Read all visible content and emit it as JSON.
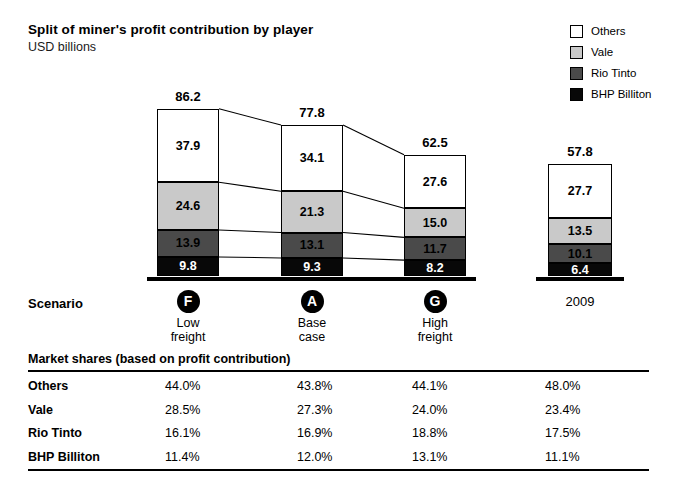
{
  "header": {
    "title": "Split of miner's profit contribution by player",
    "subtitle": "USD billions"
  },
  "legend": {
    "items": [
      {
        "label": "Others",
        "color": "#ffffff",
        "swatch": "others-swatch"
      },
      {
        "label": "Vale",
        "color": "#c9c9c9",
        "swatch": "vale-swatch"
      },
      {
        "label": "Rio Tinto",
        "color": "#4a4a4a",
        "swatch": "rio-tinto-swatch"
      },
      {
        "label": "BHP Billiton",
        "color": "#080808",
        "swatch": "bhp-billiton-swatch"
      }
    ]
  },
  "axis": {
    "scenario_label": "Scenario",
    "columns": [
      {
        "badge": "F",
        "line1": "Low",
        "line2": "freight",
        "is_year": false
      },
      {
        "badge": "A",
        "line1": "Base",
        "line2": "case",
        "is_year": false
      },
      {
        "badge": "G",
        "line1": "High",
        "line2": "freight",
        "is_year": false
      },
      {
        "badge": "",
        "line1": "2009",
        "line2": "",
        "is_year": true
      }
    ]
  },
  "table": {
    "title": "Market shares (based on profit contribution)",
    "rows": [
      {
        "name": "Others",
        "values": [
          "44.0%",
          "43.8%",
          "44.1%",
          "48.0%"
        ]
      },
      {
        "name": "Vale",
        "values": [
          "28.5%",
          "27.3%",
          "24.0%",
          "23.4%"
        ]
      },
      {
        "name": "Rio Tinto",
        "values": [
          "16.1%",
          "16.9%",
          "18.8%",
          "17.5%"
        ]
      },
      {
        "name": "BHP Billiton",
        "values": [
          "11.4%",
          "12.0%",
          "13.1%",
          "11.1%"
        ]
      }
    ]
  },
  "chart_data": {
    "type": "bar",
    "stacked": true,
    "title": "Split of miner's profit contribution by player",
    "subtitle": "USD billions",
    "xlabel": "Scenario",
    "ylabel": "USD billions",
    "categories": [
      "Low freight",
      "Base case",
      "High freight",
      "2009"
    ],
    "category_badges": [
      "F",
      "A",
      "G",
      ""
    ],
    "series": [
      {
        "name": "Others",
        "color": "#ffffff",
        "values": [
          37.9,
          34.1,
          27.6,
          27.7
        ]
      },
      {
        "name": "Vale",
        "color": "#c9c9c9",
        "values": [
          24.6,
          21.3,
          15.0,
          13.5
        ]
      },
      {
        "name": "Rio Tinto",
        "color": "#4a4a4a",
        "values": [
          13.9,
          13.1,
          11.7,
          10.1
        ]
      },
      {
        "name": "BHP Billiton",
        "color": "#080808",
        "values": [
          9.8,
          9.3,
          8.2,
          6.4
        ]
      }
    ],
    "totals": [
      86.2,
      77.8,
      62.5,
      57.8
    ],
    "total_labels": [
      "86.2",
      "77.8",
      "62.5",
      "57.8"
    ],
    "ylim": [
      0,
      90
    ],
    "grid": false,
    "legend_position": "top-right",
    "connectors": true,
    "shares_table": {
      "title": "Market shares (based on profit contribution)",
      "row_labels": [
        "Others",
        "Vale",
        "Rio Tinto",
        "BHP Billiton"
      ],
      "columns": [
        "Low freight",
        "Base case",
        "High freight",
        "2009"
      ],
      "values": [
        [
          "44.0%",
          "43.8%",
          "44.1%",
          "48.0%"
        ],
        [
          "28.5%",
          "27.3%",
          "24.0%",
          "23.4%"
        ],
        [
          "16.1%",
          "16.9%",
          "18.8%",
          "17.5%"
        ],
        [
          "11.4%",
          "12.0%",
          "13.1%",
          "11.1%"
        ]
      ]
    }
  },
  "geometry": {
    "bars": [
      {
        "x": 157,
        "w": 62
      },
      {
        "x": 281,
        "w": 62
      },
      {
        "x": 404,
        "w": 62
      },
      {
        "x": 548,
        "w": 64
      }
    ],
    "baseline_y": 216,
    "px_per_unit": 1.94
  }
}
